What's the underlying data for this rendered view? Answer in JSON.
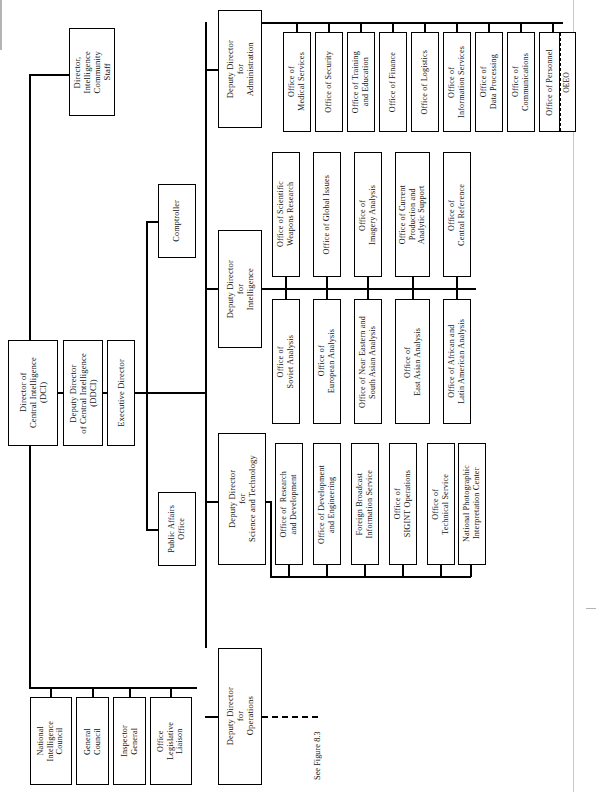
{
  "figure": {
    "orientation": "rotated-90-counterclockwise",
    "cross_reference": "See Figure 8.3"
  },
  "nodes": {
    "dci": "Director of\nCentral Intelligence\n(DCI)",
    "ddci": "Deputy Director\nof Central Intelligence\n(DDCI)",
    "exec_director": "Executive Director",
    "ic_staff": "Director,\nIntelligence\nCommunity\nStaff",
    "comptroller": "Comptroller",
    "public_affairs": "Public Affairs\nOffice",
    "dd_administration": "Deputy Director\nfor\nAdministration",
    "dd_intelligence": "Deputy Director\nfor\nIntelligence",
    "dd_science_tech": "Deputy Director\nfor\nScience and Technology",
    "dd_operations": "Deputy Director\nfor\nOperations"
  },
  "dci_staff_offices": [
    "National\nIntelligence\nCouncil",
    "General\nCouncil",
    "Inspector\nGeneral",
    "Office\nLegislative\nLiaison"
  ],
  "administration_offices": [
    "Office of\nMedical Services",
    "Office of Security",
    "Office of Training\nand Education",
    "Office of Finance",
    "Office of Logistics",
    "Office of\nInformation Services",
    "Office of\nData Processing",
    "Office of\nCommunications",
    "Office of Personnel",
    "OEEO"
  ],
  "intelligence_offices_upper": [
    "Office of Scientific\nWeapons Research",
    "Office of Global Issues",
    "Office of\nImagery Analysis",
    "Office of Current\nProduction and\nAnalytic Support",
    "Office of\nCentral Reference"
  ],
  "intelligence_offices_lower": [
    "Office of\nSoviet Analysis",
    "Office of\nEuropean Analysis",
    "Office of Near Eastern and\nSouth Asian Analysis",
    "Office of\nEast Asian Analysis",
    "Office of African and\nLatin American Analysis"
  ],
  "science_technology_offices": [
    "Office of  Research\nand Development",
    "Office of Development\nand Engineering",
    "Foreign Broadcast\nInformation Service",
    "Office of\nSIGINT Operations",
    "Office of\nTechnical Service",
    "National Photographic\nInterpretation Center"
  ]
}
